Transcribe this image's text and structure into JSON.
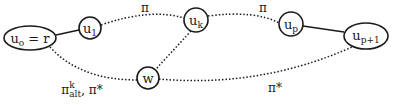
{
  "diagram": {
    "nodes": [
      {
        "id": "u0",
        "base": "u",
        "sub": "o",
        "suffix": " = r",
        "shape": "ellipse"
      },
      {
        "id": "u1",
        "base": "u",
        "sub": "1",
        "shape": "circle"
      },
      {
        "id": "uk",
        "base": "u",
        "sub": "k",
        "shape": "circle"
      },
      {
        "id": "w",
        "base": "w",
        "sub": "",
        "shape": "circle"
      },
      {
        "id": "up",
        "base": "u",
        "sub": "p",
        "shape": "circle"
      },
      {
        "id": "up1",
        "base": "u",
        "sub": "p+1",
        "shape": "ellipse"
      }
    ],
    "edges": [
      {
        "from": "u0",
        "to": "u1",
        "style": "solid"
      },
      {
        "from": "u1",
        "to": "uk",
        "style": "dotted",
        "label": "π"
      },
      {
        "from": "uk",
        "to": "up",
        "style": "dotted",
        "label": "π"
      },
      {
        "from": "up",
        "to": "up1",
        "style": "solid"
      },
      {
        "from": "uk",
        "to": "w",
        "style": "dotted"
      },
      {
        "from": "u0",
        "to": "w",
        "style": "dotted",
        "label": "π_alt^k, π*"
      },
      {
        "from": "w",
        "to": "up1",
        "style": "dotted",
        "label": "π*"
      }
    ],
    "labels": {
      "pi_top_left": "π",
      "pi_top_right": "π",
      "pi_alt_base": "π",
      "pi_alt_sup": "k",
      "pi_alt_sub": "alt",
      "pi_alt_tail": ", π*",
      "pi_star_bottom": "π*"
    },
    "colors": {
      "stroke": "#1a1a1a",
      "background": "#ffffff"
    }
  }
}
